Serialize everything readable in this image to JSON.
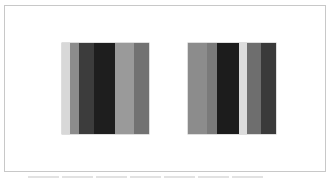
{
  "figure": {
    "frame_border_color": "#c8c8c8",
    "panels": [
      {
        "name": "left-panel",
        "left": 62,
        "width": 87,
        "stripes": [
          {
            "width": 8,
            "color": "#d8d8d8"
          },
          {
            "width": 9,
            "color": "#8c8c8c"
          },
          {
            "width": 15,
            "color": "#3c3c3c"
          },
          {
            "width": 21,
            "color": "#1e1e1e"
          },
          {
            "width": 19,
            "color": "#9a9a9a"
          },
          {
            "width": 15,
            "color": "#727272"
          }
        ]
      },
      {
        "name": "right-panel",
        "left": 188,
        "width": 88,
        "stripes": [
          {
            "width": 19,
            "color": "#8c8c8c"
          },
          {
            "width": 10,
            "color": "#7a7a7a"
          },
          {
            "width": 22,
            "color": "#1c1c1c"
          },
          {
            "width": 8,
            "color": "#dcdcdc"
          },
          {
            "width": 14,
            "color": "#6e6e6e"
          },
          {
            "width": 15,
            "color": "#3a3a3a"
          }
        ]
      }
    ],
    "caption_segments": 7
  }
}
